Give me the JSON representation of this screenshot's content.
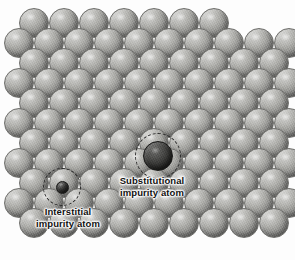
{
  "figure": {
    "kind": "schematic-diagram",
    "width": 295,
    "height": 260,
    "background_color": "#fdfdfd"
  },
  "labels": {
    "substitutional": "Substitutional\nimpurity atom",
    "interstitial": "Interstitial\nimpurity atom"
  },
  "colors": {
    "host_atom": "#939390",
    "host_atom_highlight": "#d8d8d6",
    "host_atom_shadow": "#616160",
    "impurity_atom": "#282826",
    "ring_stroke": "#2b2b2b",
    "label_text": "#111111"
  },
  "lattice": {
    "description": "Close-packed array of identical light-gray host spheres arranged in staggered rows",
    "sphere_diameter": 30,
    "row_pitch": 22,
    "column_pitch": 30,
    "row_offset": 15,
    "rows": 11,
    "atoms_per_row": 10,
    "rows_spec": [
      {
        "index": 0,
        "y": 8,
        "x_start": 19,
        "count": 7,
        "stagger": "offset",
        "partial": true
      },
      {
        "index": 1,
        "y": 28,
        "x_start": 4,
        "count": 10,
        "stagger": "aligned"
      },
      {
        "index": 2,
        "y": 48,
        "x_start": 19,
        "count": 9,
        "stagger": "offset"
      },
      {
        "index": 3,
        "y": 68,
        "x_start": 4,
        "count": 10,
        "stagger": "aligned"
      },
      {
        "index": 4,
        "y": 88,
        "x_start": 19,
        "count": 9,
        "stagger": "offset"
      },
      {
        "index": 5,
        "y": 108,
        "x_start": 4,
        "count": 10,
        "stagger": "aligned"
      },
      {
        "index": 6,
        "y": 128,
        "x_start": 19,
        "count": 9,
        "stagger": "offset"
      },
      {
        "index": 7,
        "y": 148,
        "x_start": 4,
        "count": 10,
        "stagger": "aligned"
      },
      {
        "index": 8,
        "y": 168,
        "x_start": 19,
        "count": 9,
        "stagger": "offset"
      },
      {
        "index": 9,
        "y": 188,
        "x_start": 4,
        "count": 10,
        "stagger": "aligned"
      },
      {
        "index": 10,
        "y": 208,
        "x_start": 19,
        "count": 9,
        "stagger": "offset"
      }
    ]
  },
  "defects": [
    {
      "id": "substitutional",
      "name": "Substitutional impurity atom",
      "type": "substitutional",
      "center_x": 158,
      "center_y": 156,
      "diameter": 30,
      "color": "#282826",
      "ring": {
        "center_x": 158,
        "center_y": 156,
        "diameter": 46
      },
      "note": "Dark sphere occupying a regular host lattice site"
    },
    {
      "id": "interstitial",
      "name": "Interstitial impurity atom",
      "type": "interstitial",
      "center_x": 62,
      "center_y": 187,
      "diameter": 13,
      "color": "#282826",
      "ring": {
        "center_x": 62,
        "center_y": 187,
        "diameter": 38
      },
      "note": "Small dark sphere squeezed into the void between host atoms"
    }
  ]
}
